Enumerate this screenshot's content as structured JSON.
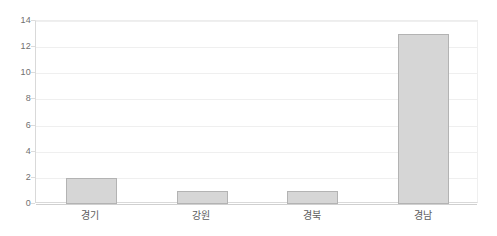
{
  "chart_data": {
    "type": "bar",
    "title": "",
    "subtitle": "",
    "xlabel": "",
    "ylabel": "",
    "categories": [
      "경기",
      "강원",
      "경북",
      "경남"
    ],
    "values": [
      2,
      1,
      1,
      13
    ],
    "series": [
      {
        "name": "",
        "values": [
          2,
          1,
          1,
          13
        ]
      }
    ],
    "ylim": [
      0,
      14
    ],
    "yticks": [
      0,
      2,
      4,
      6,
      8,
      10,
      12,
      14
    ],
    "ytick_labels": [
      "0",
      "2",
      "4",
      "6",
      "8",
      "10",
      "12",
      "14"
    ],
    "grid": true,
    "grid_axis": "y",
    "legend": false,
    "legend_position": "none",
    "annotations": [],
    "colors": {
      "bar_fill": "#d6d6d6",
      "bar_border": "#b3b3b3",
      "gridline": "#efefef",
      "axis": "#d0d0d0",
      "tick_text": "#6f6f6f",
      "category_text": "#5d5d5d",
      "background": "#ffffff"
    }
  }
}
